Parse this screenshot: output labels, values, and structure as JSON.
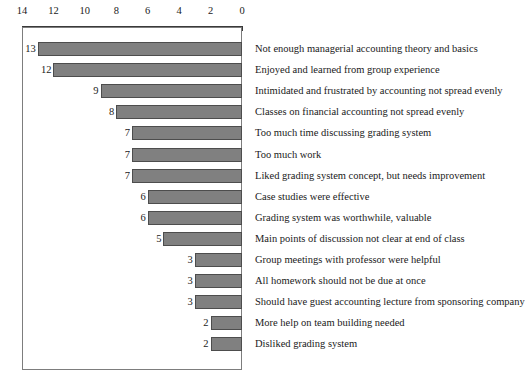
{
  "chart_data": {
    "type": "bar",
    "orientation": "horizontal",
    "title": "",
    "subtitle": "",
    "xlabel": "",
    "ylabel": "",
    "xlim": [
      14,
      0
    ],
    "reversed_x_axis": true,
    "grid": false,
    "legend": null,
    "bar_color": "#808080",
    "bar_border_color": "#4d4d4d",
    "axis_color": "#3a3a3a",
    "plot_border_color": "#7d7d7d",
    "tick_labels": [
      "14",
      "12",
      "10",
      "8",
      "6",
      "4",
      "2",
      "0"
    ],
    "tick_values": [
      14,
      12,
      10,
      8,
      6,
      4,
      2,
      0
    ],
    "categories": [
      "Not enough managerial accounting theory and basics",
      "Enjoyed and learned from group experience",
      "Intimidated and frustrated by accounting not spread evenly",
      "Classes on financial accounting not spread evenly",
      "Too much time discussing grading system",
      "Too much work",
      "Liked grading system concept, but needs improvement",
      "Case studies were effective",
      "Grading system was worthwhile, valuable",
      "Main points of discussion not clear at end of class",
      "Group meetings with professor were helpful",
      "All homework should not be due at once",
      "Should have guest accounting lecture from sponsoring company",
      "More help on team building needed",
      "Disliked grading system"
    ],
    "values": [
      13,
      12,
      9,
      8,
      7,
      7,
      7,
      6,
      6,
      5,
      3,
      3,
      3,
      2,
      2
    ],
    "value_labels": [
      "13",
      "12",
      "9",
      "8",
      "7",
      "7",
      "7",
      "6",
      "6",
      "5",
      "3",
      "3",
      "3",
      "2",
      "2"
    ]
  }
}
